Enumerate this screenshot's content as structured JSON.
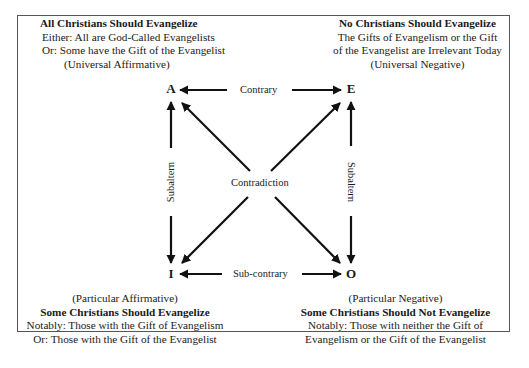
{
  "diagram": {
    "type": "square-of-opposition",
    "corners": {
      "A": {
        "letter": "A",
        "title": "All Christians Should Evangelize",
        "lines": [
          "Either: All are God-Called Evangelists",
          "Or: Some have the Gift of the Evangelist"
        ],
        "classification": "(Universal Affirmative)"
      },
      "E": {
        "letter": "E",
        "title": "No Christians Should Evangelize",
        "lines": [
          "The Gifts of Evangelism or the Gift",
          "of the Evangelist are Irrelevant Today"
        ],
        "classification": "(Universal Negative)"
      },
      "I": {
        "letter": "I",
        "classification": "(Particular Affirmative)",
        "title": "Some Christians Should Evangelize",
        "lines": [
          "Notably: Those with the Gift of Evangelism",
          "Or: Those with the Gift of the Evangelist"
        ]
      },
      "O": {
        "letter": "O",
        "classification": "(Particular Negative)",
        "title": "Some Christians Should Not Evangelize",
        "lines": [
          "Notably: Those with neither the Gift of",
          "Evangelism or the Gift of the Evangelist"
        ]
      }
    },
    "relations": {
      "top": "Contrary",
      "bottom": "Sub-contrary",
      "left": "Subaltern",
      "right": "Subaltern",
      "center": "Contradiction"
    },
    "colors": {
      "line": "#111111",
      "border": "#555555",
      "text": "#1a1a1a"
    }
  }
}
